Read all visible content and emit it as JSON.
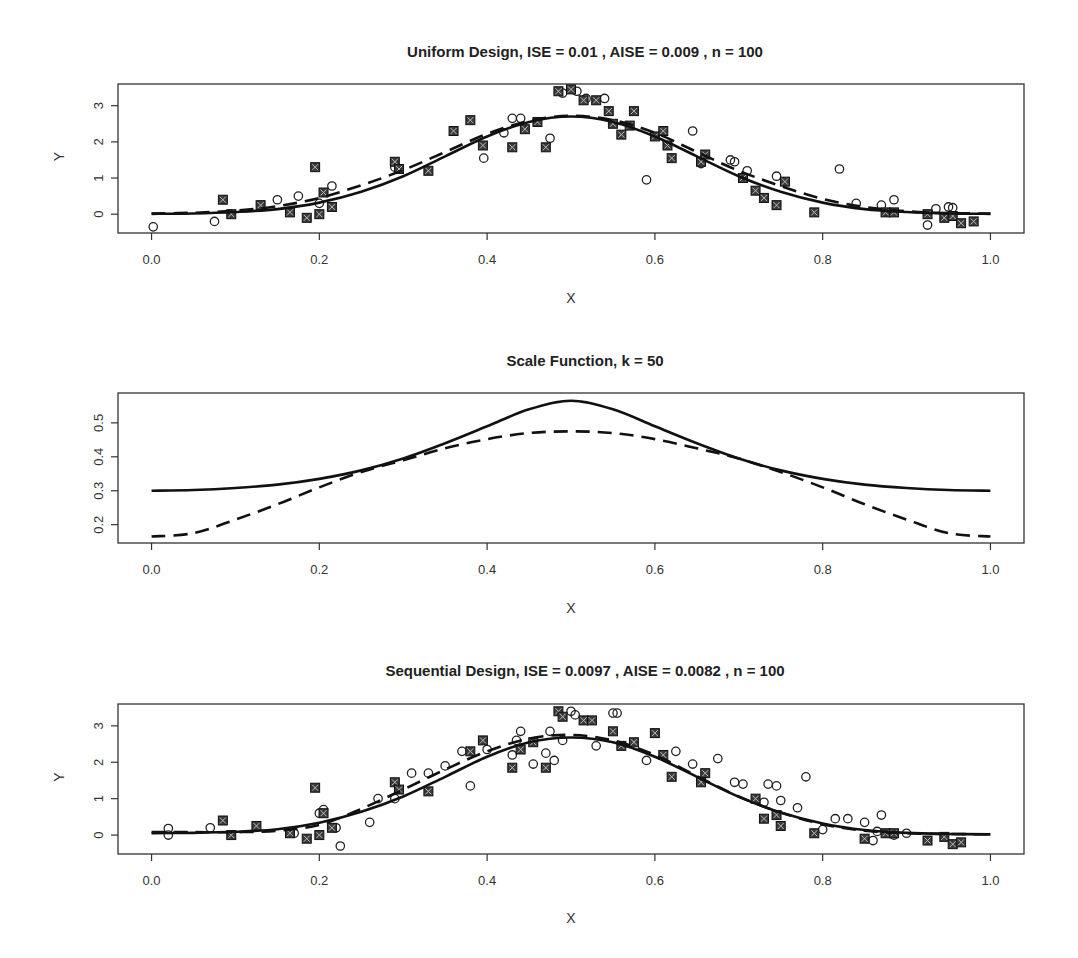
{
  "chart_data": [
    {
      "type": "scatter",
      "title": "Uniform Design,  ISE =  0.01 ,  AISE =  0.009 ,  n =  100",
      "xlabel": "X",
      "ylabel": "Y",
      "xlim": [
        -0.04,
        1.04
      ],
      "ylim": [
        -0.52,
        3.6
      ],
      "xticks": [
        "0.0",
        "0.2",
        "0.4",
        "0.6",
        "0.8",
        "1.0"
      ],
      "xtick_values": [
        0,
        0.2,
        0.4,
        0.6,
        0.8,
        1.0
      ],
      "yticks": [
        "0",
        "1",
        "2",
        "3"
      ],
      "ytick_values": [
        0,
        1,
        2,
        3
      ],
      "grid": false,
      "series": [
        {
          "name": "true function",
          "kind": "line",
          "style": "solid",
          "x": [
            0,
            0.05,
            0.1,
            0.15,
            0.2,
            0.25,
            0.3,
            0.35,
            0.4,
            0.45,
            0.5,
            0.55,
            0.6,
            0.65,
            0.7,
            0.75,
            0.8,
            0.85,
            0.9,
            0.95,
            1.0
          ],
          "y": [
            0.01,
            0.02,
            0.06,
            0.14,
            0.32,
            0.62,
            1.05,
            1.6,
            2.15,
            2.55,
            2.7,
            2.55,
            2.15,
            1.6,
            1.05,
            0.62,
            0.32,
            0.14,
            0.06,
            0.02,
            0.01
          ]
        },
        {
          "name": "estimate",
          "kind": "line",
          "style": "dashed",
          "x": [
            0,
            0.05,
            0.1,
            0.15,
            0.2,
            0.25,
            0.3,
            0.35,
            0.4,
            0.45,
            0.5,
            0.55,
            0.6,
            0.65,
            0.7,
            0.75,
            0.8,
            0.85,
            0.9,
            0.95,
            1.0
          ],
          "y": [
            0.02,
            0.04,
            0.1,
            0.22,
            0.45,
            0.8,
            1.22,
            1.72,
            2.22,
            2.58,
            2.72,
            2.6,
            2.25,
            1.72,
            1.2,
            0.78,
            0.42,
            0.2,
            0.08,
            0.03,
            0.02
          ]
        },
        {
          "name": "design points (open circle)",
          "kind": "points",
          "marker": "circle",
          "x": [
            0.002,
            0.075,
            0.15,
            0.175,
            0.2,
            0.215,
            0.29,
            0.396,
            0.42,
            0.43,
            0.44,
            0.475,
            0.49,
            0.507,
            0.518,
            0.54,
            0.59,
            0.645,
            0.655,
            0.69,
            0.695,
            0.71,
            0.745,
            0.82,
            0.84,
            0.87,
            0.885,
            0.925,
            0.935,
            0.95,
            0.955
          ],
          "y": [
            -0.35,
            -0.2,
            0.4,
            0.5,
            0.3,
            0.78,
            1.3,
            1.55,
            2.25,
            2.65,
            2.65,
            2.1,
            3.35,
            3.4,
            3.2,
            3.2,
            0.95,
            2.3,
            1.4,
            1.5,
            1.45,
            1.2,
            1.05,
            1.25,
            0.3,
            0.25,
            0.4,
            -0.3,
            0.15,
            0.2,
            0.18
          ]
        },
        {
          "name": "design points (boxed cross)",
          "kind": "points",
          "marker": "square-x",
          "x": [
            0.085,
            0.095,
            0.13,
            0.165,
            0.185,
            0.195,
            0.2,
            0.205,
            0.215,
            0.29,
            0.295,
            0.33,
            0.36,
            0.38,
            0.395,
            0.43,
            0.445,
            0.46,
            0.47,
            0.485,
            0.5,
            0.515,
            0.53,
            0.545,
            0.55,
            0.56,
            0.57,
            0.575,
            0.6,
            0.615,
            0.61,
            0.62,
            0.655,
            0.66,
            0.705,
            0.72,
            0.73,
            0.745,
            0.755,
            0.79,
            0.875,
            0.885,
            0.925,
            0.945,
            0.955,
            0.965,
            0.98
          ],
          "y": [
            0.4,
            0.0,
            0.25,
            0.05,
            -0.1,
            1.3,
            0.0,
            0.6,
            0.2,
            1.45,
            1.25,
            1.2,
            2.3,
            2.6,
            1.9,
            1.85,
            2.35,
            2.55,
            1.85,
            3.4,
            3.45,
            3.15,
            3.15,
            2.85,
            2.5,
            2.2,
            2.45,
            2.85,
            2.15,
            1.9,
            2.3,
            1.55,
            1.45,
            1.65,
            1.0,
            0.65,
            0.45,
            0.25,
            0.9,
            0.05,
            0.05,
            0.05,
            0.0,
            -0.1,
            -0.05,
            -0.25,
            -0.2
          ]
        }
      ]
    },
    {
      "type": "line",
      "title": "Scale Function,  k =  50",
      "xlabel": "X",
      "ylabel": "",
      "xlim": [
        -0.04,
        1.04
      ],
      "ylim": [
        0.146,
        0.588
      ],
      "xticks": [
        "0.0",
        "0.2",
        "0.4",
        "0.6",
        "0.8",
        "1.0"
      ],
      "xtick_values": [
        0,
        0.2,
        0.4,
        0.6,
        0.8,
        1.0
      ],
      "yticks": [
        "0.2",
        "0.3",
        "0.4",
        "0.5"
      ],
      "ytick_values": [
        0.2,
        0.3,
        0.4,
        0.5
      ],
      "grid": false,
      "series": [
        {
          "name": "scale (uniform)",
          "style": "solid",
          "x": [
            0,
            0.05,
            0.1,
            0.15,
            0.2,
            0.25,
            0.3,
            0.35,
            0.4,
            0.45,
            0.5,
            0.55,
            0.6,
            0.65,
            0.7,
            0.75,
            0.8,
            0.85,
            0.9,
            0.95,
            1.0
          ],
          "y": [
            0.3,
            0.302,
            0.308,
            0.318,
            0.335,
            0.36,
            0.395,
            0.44,
            0.49,
            0.54,
            0.565,
            0.54,
            0.49,
            0.44,
            0.395,
            0.36,
            0.335,
            0.318,
            0.308,
            0.302,
            0.3
          ]
        },
        {
          "name": "scale (sequential)",
          "style": "dashed",
          "x": [
            0,
            0.05,
            0.1,
            0.15,
            0.2,
            0.25,
            0.3,
            0.35,
            0.4,
            0.45,
            0.5,
            0.55,
            0.6,
            0.65,
            0.7,
            0.75,
            0.8,
            0.85,
            0.9,
            0.95,
            1.0
          ],
          "y": [
            0.165,
            0.175,
            0.215,
            0.26,
            0.31,
            0.355,
            0.39,
            0.425,
            0.452,
            0.47,
            0.475,
            0.47,
            0.452,
            0.425,
            0.395,
            0.355,
            0.31,
            0.26,
            0.215,
            0.175,
            0.165
          ]
        }
      ]
    },
    {
      "type": "scatter",
      "title": "Sequential Design,  ISE =  0.0097 ,  AISE =  0.0082 ,  n =  100",
      "xlabel": "X",
      "ylabel": "Y",
      "xlim": [
        -0.04,
        1.04
      ],
      "ylim": [
        -0.52,
        3.6
      ],
      "xticks": [
        "0.0",
        "0.2",
        "0.4",
        "0.6",
        "0.8",
        "1.0"
      ],
      "xtick_values": [
        0,
        0.2,
        0.4,
        0.6,
        0.8,
        1.0
      ],
      "yticks": [
        "0",
        "1",
        "2",
        "3"
      ],
      "ytick_values": [
        0,
        1,
        2,
        3
      ],
      "grid": false,
      "series": [
        {
          "name": "true function",
          "kind": "line",
          "style": "solid",
          "x": [
            0,
            0.05,
            0.1,
            0.15,
            0.2,
            0.25,
            0.3,
            0.35,
            0.4,
            0.45,
            0.5,
            0.55,
            0.6,
            0.65,
            0.7,
            0.75,
            0.8,
            0.85,
            0.9,
            0.95,
            1.0
          ],
          "y": [
            0.05,
            0.06,
            0.09,
            0.16,
            0.34,
            0.64,
            1.06,
            1.6,
            2.15,
            2.55,
            2.68,
            2.55,
            2.15,
            1.6,
            1.05,
            0.62,
            0.32,
            0.14,
            0.06,
            0.03,
            0.02
          ]
        },
        {
          "name": "estimate",
          "kind": "line",
          "style": "dashed",
          "x": [
            0,
            0.05,
            0.1,
            0.15,
            0.2,
            0.25,
            0.3,
            0.35,
            0.4,
            0.45,
            0.5,
            0.55,
            0.6,
            0.65,
            0.7,
            0.75,
            0.8,
            0.85,
            0.9,
            0.95,
            1.0
          ],
          "y": [
            0.08,
            0.08,
            0.08,
            0.12,
            0.28,
            0.72,
            1.25,
            1.8,
            2.3,
            2.65,
            2.75,
            2.6,
            2.2,
            1.62,
            1.06,
            0.62,
            0.3,
            0.12,
            0.05,
            0.03,
            0.02
          ]
        },
        {
          "name": "design points (open circle)",
          "kind": "points",
          "marker": "circle",
          "x": [
            0.02,
            0.02,
            0.07,
            0.17,
            0.2,
            0.205,
            0.22,
            0.225,
            0.26,
            0.27,
            0.29,
            0.31,
            0.33,
            0.35,
            0.37,
            0.38,
            0.4,
            0.43,
            0.435,
            0.44,
            0.455,
            0.47,
            0.475,
            0.48,
            0.49,
            0.505,
            0.5,
            0.53,
            0.55,
            0.555,
            0.59,
            0.625,
            0.645,
            0.675,
            0.695,
            0.705,
            0.73,
            0.735,
            0.745,
            0.75,
            0.77,
            0.78,
            0.8,
            0.815,
            0.83,
            0.85,
            0.86,
            0.865,
            0.87,
            0.885,
            0.9
          ],
          "y": [
            0.18,
            0.0,
            0.2,
            0.05,
            0.6,
            0.7,
            0.2,
            -0.3,
            0.35,
            1.0,
            1.0,
            1.7,
            1.7,
            1.9,
            2.3,
            1.35,
            2.35,
            2.2,
            2.6,
            2.85,
            1.95,
            2.25,
            2.85,
            2.05,
            2.6,
            3.3,
            3.4,
            2.45,
            3.35,
            3.35,
            2.05,
            2.3,
            1.95,
            2.1,
            1.45,
            1.4,
            0.9,
            1.4,
            1.35,
            0.95,
            0.75,
            1.6,
            0.15,
            0.45,
            0.45,
            0.35,
            -0.15,
            0.1,
            0.55,
            0.0,
            0.05
          ]
        },
        {
          "name": "design points (boxed cross)",
          "kind": "points",
          "marker": "square-x",
          "x": [
            0.085,
            0.095,
            0.125,
            0.165,
            0.185,
            0.195,
            0.2,
            0.205,
            0.215,
            0.29,
            0.295,
            0.33,
            0.38,
            0.395,
            0.43,
            0.44,
            0.455,
            0.47,
            0.485,
            0.49,
            0.515,
            0.525,
            0.55,
            0.56,
            0.575,
            0.6,
            0.61,
            0.62,
            0.655,
            0.66,
            0.72,
            0.73,
            0.745,
            0.75,
            0.79,
            0.85,
            0.875,
            0.885,
            0.925,
            0.945,
            0.955,
            0.965
          ],
          "y": [
            0.4,
            0.0,
            0.25,
            0.05,
            -0.1,
            1.3,
            0.0,
            0.6,
            0.2,
            1.45,
            1.25,
            1.2,
            2.3,
            2.6,
            1.85,
            2.35,
            2.55,
            1.85,
            3.4,
            3.25,
            3.15,
            3.15,
            2.85,
            2.45,
            2.55,
            2.8,
            2.2,
            1.6,
            1.45,
            1.7,
            1.0,
            0.45,
            0.55,
            0.25,
            0.05,
            -0.1,
            0.05,
            0.05,
            -0.15,
            -0.05,
            -0.25,
            -0.2
          ]
        }
      ]
    }
  ]
}
